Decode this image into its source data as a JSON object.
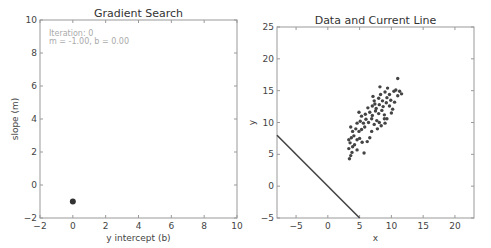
{
  "chart_data": [
    {
      "type": "scatter",
      "title": "Gradient Search",
      "xlabel": "y intercept (b)",
      "ylabel": "slope (m)",
      "xlim": [
        -2,
        10
      ],
      "ylim": [
        -2,
        10
      ],
      "xticks": [
        -2,
        0,
        2,
        4,
        6,
        8,
        10
      ],
      "yticks": [
        -2,
        0,
        2,
        4,
        6,
        8,
        10
      ],
      "grid": false,
      "annotations": [
        "Iteration: 0",
        "m = -1.00, b = 0.00"
      ],
      "points": [
        {
          "x": 0.0,
          "y": -1.0
        }
      ],
      "point_color": "#333333"
    },
    {
      "type": "scatter",
      "title": "Data and Current Line",
      "xlabel": "x",
      "ylabel": "y",
      "xlim": [
        -8,
        23
      ],
      "ylim": [
        -5,
        25
      ],
      "xticks": [
        -5,
        0,
        5,
        10,
        15,
        20
      ],
      "yticks": [
        -5,
        0,
        5,
        10,
        15,
        20,
        25
      ],
      "grid": false,
      "line": {
        "slope": -1.0,
        "intercept": 0.0,
        "color": "#444444"
      },
      "point_color": "#444444",
      "points": [
        {
          "x": 3.4,
          "y": 4.3
        },
        {
          "x": 3.6,
          "y": 4.8
        },
        {
          "x": 3.8,
          "y": 5.3
        },
        {
          "x": 3.3,
          "y": 5.9
        },
        {
          "x": 3.9,
          "y": 6.2
        },
        {
          "x": 3.5,
          "y": 6.8
        },
        {
          "x": 4.2,
          "y": 6.5
        },
        {
          "x": 4.6,
          "y": 5.7
        },
        {
          "x": 3.3,
          "y": 7.3
        },
        {
          "x": 3.7,
          "y": 7.6
        },
        {
          "x": 4.1,
          "y": 7.9
        },
        {
          "x": 4.6,
          "y": 7.3
        },
        {
          "x": 5.0,
          "y": 7.5
        },
        {
          "x": 5.4,
          "y": 6.9
        },
        {
          "x": 5.7,
          "y": 5.2
        },
        {
          "x": 6.2,
          "y": 7.0
        },
        {
          "x": 6.6,
          "y": 7.6
        },
        {
          "x": 3.9,
          "y": 8.6
        },
        {
          "x": 4.4,
          "y": 9.0
        },
        {
          "x": 4.9,
          "y": 8.6
        },
        {
          "x": 5.3,
          "y": 8.9
        },
        {
          "x": 5.8,
          "y": 9.3
        },
        {
          "x": 3.6,
          "y": 9.3
        },
        {
          "x": 4.6,
          "y": 9.9
        },
        {
          "x": 5.1,
          "y": 10.2
        },
        {
          "x": 5.6,
          "y": 9.9
        },
        {
          "x": 6.0,
          "y": 10.5
        },
        {
          "x": 6.4,
          "y": 10.0
        },
        {
          "x": 6.9,
          "y": 10.6
        },
        {
          "x": 7.3,
          "y": 9.7
        },
        {
          "x": 7.7,
          "y": 10.3
        },
        {
          "x": 8.1,
          "y": 10.0
        },
        {
          "x": 5.9,
          "y": 11.3
        },
        {
          "x": 6.6,
          "y": 11.6
        },
        {
          "x": 7.0,
          "y": 11.1
        },
        {
          "x": 7.5,
          "y": 11.8
        },
        {
          "x": 8.0,
          "y": 11.4
        },
        {
          "x": 8.5,
          "y": 11.9
        },
        {
          "x": 8.9,
          "y": 11.2
        },
        {
          "x": 9.3,
          "y": 10.6
        },
        {
          "x": 6.3,
          "y": 12.3
        },
        {
          "x": 7.0,
          "y": 12.6
        },
        {
          "x": 7.6,
          "y": 12.2
        },
        {
          "x": 8.1,
          "y": 12.8
        },
        {
          "x": 8.7,
          "y": 12.5
        },
        {
          "x": 9.2,
          "y": 13.1
        },
        {
          "x": 9.7,
          "y": 12.6
        },
        {
          "x": 10.2,
          "y": 12.1
        },
        {
          "x": 7.3,
          "y": 13.4
        },
        {
          "x": 8.0,
          "y": 13.8
        },
        {
          "x": 8.6,
          "y": 13.4
        },
        {
          "x": 9.3,
          "y": 13.9
        },
        {
          "x": 9.9,
          "y": 13.5
        },
        {
          "x": 10.5,
          "y": 13.2
        },
        {
          "x": 8.3,
          "y": 14.4
        },
        {
          "x": 9.0,
          "y": 14.8
        },
        {
          "x": 9.7,
          "y": 14.4
        },
        {
          "x": 10.4,
          "y": 14.9
        },
        {
          "x": 11.0,
          "y": 14.2
        },
        {
          "x": 11.3,
          "y": 14.9
        },
        {
          "x": 9.4,
          "y": 15.4
        },
        {
          "x": 10.7,
          "y": 15.1
        },
        {
          "x": 11.6,
          "y": 14.5
        },
        {
          "x": 11.0,
          "y": 16.9
        },
        {
          "x": 7.8,
          "y": 9.0
        },
        {
          "x": 8.4,
          "y": 9.5
        },
        {
          "x": 9.0,
          "y": 9.9
        },
        {
          "x": 6.9,
          "y": 8.6
        },
        {
          "x": 7.4,
          "y": 12.9
        },
        {
          "x": 8.9,
          "y": 10.6
        },
        {
          "x": 10.0,
          "y": 11.5
        },
        {
          "x": 5.3,
          "y": 11.0
        },
        {
          "x": 4.9,
          "y": 11.6
        },
        {
          "x": 7.1,
          "y": 14.1
        },
        {
          "x": 8.2,
          "y": 15.6
        }
      ]
    }
  ]
}
